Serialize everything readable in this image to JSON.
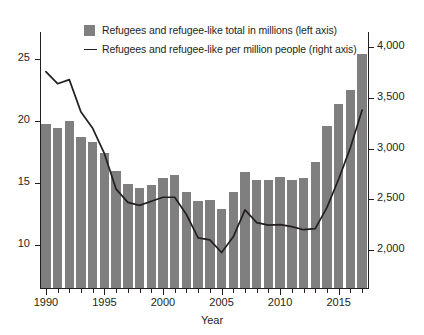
{
  "chart_data": {
    "type": "bar",
    "title": "",
    "subtitle": "",
    "xlabel": "Year",
    "ylabel": "",
    "categories": [
      1990,
      1991,
      1992,
      1993,
      1994,
      1995,
      1996,
      1997,
      1998,
      1999,
      2000,
      2001,
      2002,
      2003,
      2004,
      2005,
      2006,
      2007,
      2008,
      2009,
      2010,
      2011,
      2012,
      2013,
      2014,
      2015,
      2016,
      2017
    ],
    "x_tick_labels": [
      "1990",
      "1995",
      "2000",
      "2005",
      "2010",
      "2015"
    ],
    "x_tick_values": [
      1990,
      1995,
      2000,
      2005,
      2010,
      2015
    ],
    "minor_ticks": "every year",
    "grid": false,
    "legend_position": "top-center",
    "axes": {
      "left": {
        "label": "Refugees and refugee-like total in millions",
        "ticks": [
          10,
          15,
          20,
          25
        ],
        "tick_labels": [
          "10",
          "15",
          "20",
          "25"
        ],
        "ylim": [
          6.5,
          27.2
        ]
      },
      "right": {
        "label": "Refugees and refugee-like per million people",
        "ticks": [
          2000,
          2500,
          3000,
          3500,
          4000
        ],
        "tick_labels": [
          "2,000",
          "2,500",
          "3,000",
          "3,500",
          "4,000"
        ],
        "ylim": [
          1625,
          4150
        ]
      }
    },
    "series": [
      {
        "name": "Refugees and refugee-like total in millions (left axis)",
        "type": "bar",
        "axis": "left",
        "color": "#7f7f7f",
        "values": [
          19.8,
          19.4,
          20.0,
          18.7,
          18.3,
          17.4,
          16.0,
          14.9,
          14.6,
          14.8,
          15.4,
          15.6,
          14.3,
          13.5,
          13.6,
          12.9,
          14.3,
          15.9,
          15.2,
          15.2,
          15.5,
          15.2,
          15.4,
          16.7,
          19.6,
          21.4,
          22.5,
          25.4
        ]
      },
      {
        "name": "Refugees and refugee-like per million people (right axis)",
        "type": "line",
        "axis": "right",
        "color": "#231f20",
        "values": [
          3760,
          3640,
          3680,
          3360,
          3200,
          2950,
          2600,
          2470,
          2440,
          2480,
          2520,
          2520,
          2350,
          2120,
          2100,
          1975,
          2130,
          2395,
          2270,
          2245,
          2250,
          2230,
          2200,
          2210,
          2420,
          2700,
          3010,
          3380
        ]
      }
    ]
  },
  "legend": {
    "items": [
      {
        "marker": "swatch",
        "label": "Refugees and refugee-like total in millions (left axis)"
      },
      {
        "marker": "line",
        "label": "Refugees and refugee-like per million people (right axis)"
      }
    ]
  },
  "axis_titles": {
    "x": "Year"
  },
  "colors": {
    "bar": "#7f7f7f",
    "line": "#231f20",
    "axis": "#231f20",
    "background": "#ffffff"
  }
}
